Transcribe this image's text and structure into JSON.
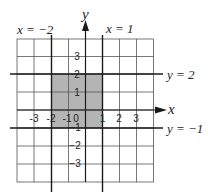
{
  "figure": {
    "axes": {
      "x_label": "x",
      "y_label": "y",
      "x_ticks": [
        {
          "value": -3,
          "label": "-3"
        },
        {
          "value": -2,
          "label": "-2"
        },
        {
          "value": -1,
          "label": "-1"
        },
        {
          "value": 0,
          "label": "0"
        },
        {
          "value": 1,
          "label": "1"
        },
        {
          "value": 2,
          "label": "2"
        },
        {
          "value": 3,
          "label": "3"
        }
      ],
      "y_ticks": [
        {
          "value": 3,
          "label": "3"
        },
        {
          "value": 2,
          "label": "2"
        },
        {
          "value": 1,
          "label": "1"
        },
        {
          "value": -1,
          "label": "−1"
        },
        {
          "value": -2,
          "label": "−2"
        },
        {
          "value": -3,
          "label": "−3"
        }
      ],
      "grid": {
        "x_min": -5,
        "x_max": 3,
        "y_min": -4,
        "y_max": 4
      }
    },
    "boundary_lines": [
      {
        "id": "x_neg2",
        "label": "x = −2"
      },
      {
        "id": "x_1",
        "label": "x = 1"
      },
      {
        "id": "y_2",
        "label": "y = 2"
      },
      {
        "id": "y_neg1",
        "label": "y = −1"
      }
    ],
    "shaded_region": {
      "x_from": -2,
      "x_to": 1,
      "y_from": -1,
      "y_to": 2,
      "color": "#b4b4b4"
    },
    "colors": {
      "grid": "#555555",
      "lines": "#1a1a1a",
      "text": "#222222"
    }
  }
}
